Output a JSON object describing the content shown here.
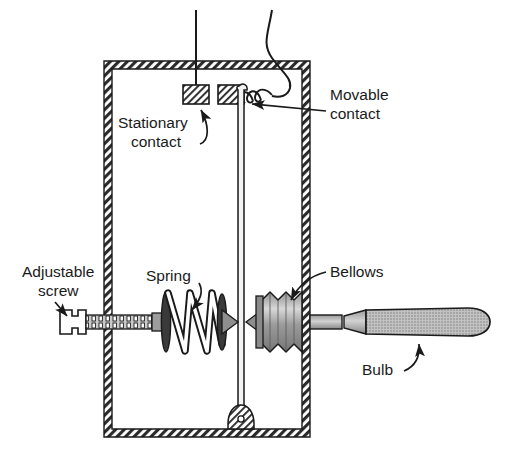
{
  "figure": {
    "background_color": "#ffffff",
    "line_color": "#1a1a1a",
    "hatch_color": "#2b2b2b",
    "metal_fill": "#a8a8a8",
    "bellows_fill": "#bcbcbc",
    "bulb_fill": "#b0b0b0"
  },
  "labels": {
    "stationary_contact_line1": "Stationary",
    "stationary_contact_line2": "contact",
    "movable_contact_line1": "Movable",
    "movable_contact_line2": "contact",
    "adjustable_screw_line1": "Adjustable",
    "adjustable_screw_line2": "screw",
    "spring": "Spring",
    "bellows": "Bellows",
    "bulb": "Bulb"
  },
  "parts": [
    {
      "name": "enclosure",
      "description": "hatched rectangular housing wall"
    },
    {
      "name": "stationary-contact",
      "description": "hatched block fixed to upper wall lead"
    },
    {
      "name": "movable-contact",
      "description": "hatched block on lever arm with flexible coiled lead"
    },
    {
      "name": "lever-arm",
      "description": "vertical rod pivoting at the base of the housing"
    },
    {
      "name": "pivot",
      "description": "hatched pivot block at the bottom wall"
    },
    {
      "name": "adjustable-screw",
      "description": "threaded screw with slotted head entering the left wall"
    },
    {
      "name": "spring",
      "description": "helical compression spring between two plates"
    },
    {
      "name": "bellows",
      "description": "corrugated expansion bellows"
    },
    {
      "name": "bulb",
      "description": "sensing bulb capsule connected by capillary stem"
    },
    {
      "name": "lead-wire-left",
      "description": "wire entering the top wall to the stationary contact"
    },
    {
      "name": "lead-wire-right",
      "description": "wire entering the top wall to the flexible coiled lead"
    }
  ]
}
